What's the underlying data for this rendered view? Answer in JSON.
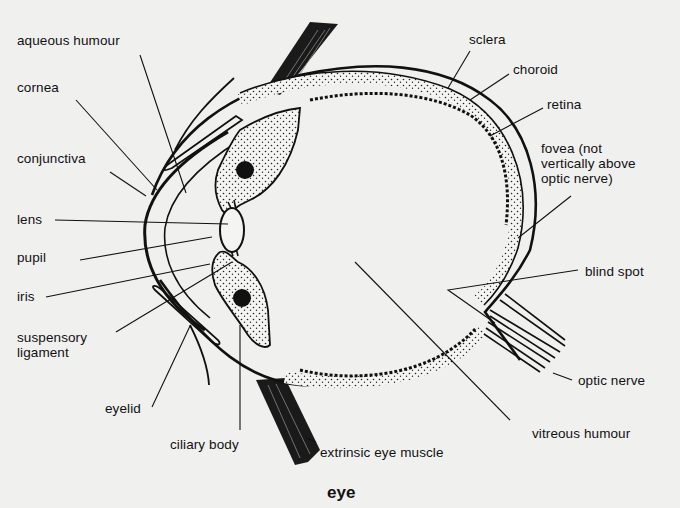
{
  "diagram": {
    "title": "eye",
    "labels": {
      "aqueous_humour": "aqueous humour",
      "cornea": "cornea",
      "conjunctiva": "conjunctiva",
      "lens": "lens",
      "pupil": "pupil",
      "iris": "iris",
      "suspensory_ligament": "suspensory\nligament",
      "eyelid": "eyelid",
      "ciliary_body": "ciliary body",
      "extrinsic_eye_muscle": "extrinsic eye muscle",
      "vitreous_humour": "vitreous humour",
      "optic_nerve": "optic nerve",
      "blind_spot": "blind spot",
      "fovea": "fovea (not\nvertically above\noptic nerve)",
      "retina": "retina",
      "choroid": "choroid",
      "sclera": "sclera"
    }
  }
}
